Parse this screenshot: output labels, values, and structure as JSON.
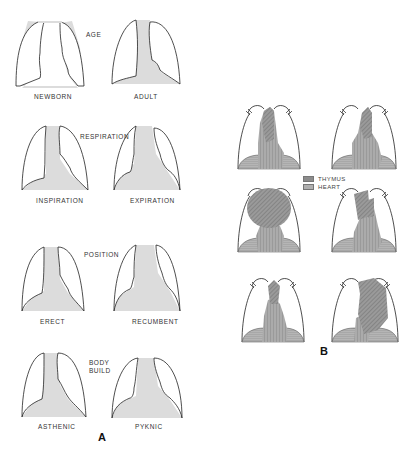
{
  "panel_a": {
    "letter": "A",
    "groups": [
      {
        "title": "AGE",
        "left_label": "NEWBORN",
        "right_label": "ADULT"
      },
      {
        "title": "RESPIRATION",
        "left_label": "INSPIRATION",
        "right_label": "EXPIRATION"
      },
      {
        "title": "POSITION",
        "left_label": "ERECT",
        "right_label": "RECUMBENT"
      },
      {
        "title_line1": "BODY",
        "title_line2": "BUILD",
        "left_label": "ASTHENIC",
        "right_label": "PYKNIC"
      }
    ]
  },
  "panel_b": {
    "letter": "B",
    "legend": [
      {
        "label": "THYMUS",
        "color": "#8a8a8a"
      },
      {
        "label": "HEART",
        "color": "#a0a0a0"
      }
    ]
  },
  "colors": {
    "mediastinum_fill": "#dcdcdc",
    "outline": "#222222",
    "thymus": "#8c8c8c",
    "heart": "#a6a6a6"
  }
}
